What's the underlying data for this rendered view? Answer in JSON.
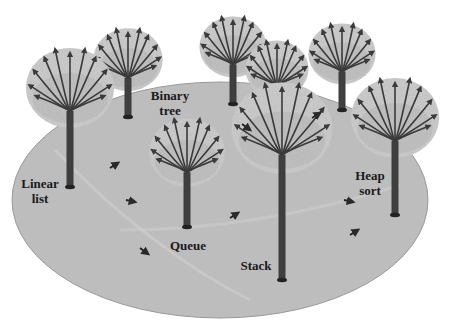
{
  "diagram": {
    "type": "illustration",
    "colors": {
      "ground": "#b9b9b9",
      "ground_edge": "#9a9a9a",
      "foliage": "#c9c9c9",
      "foliage_dark": "#aaaaaa",
      "trunk": "#4a4a4a",
      "branch": "#3a3a3a",
      "label": "#1a1a1a"
    },
    "labels": {
      "linear_list": "Linear\nlist",
      "binary_tree": "Binary\ntree",
      "queue": "Queue",
      "stack": "Stack",
      "heap_sort": "Heap\nsort"
    },
    "trees": [
      {
        "id": "linear-list-tree",
        "x": 70,
        "top": 50,
        "base": 187,
        "crown_r": 42
      },
      {
        "id": "background-tree-1",
        "x": 128,
        "top": 30,
        "base": 117,
        "crown_r": 33
      },
      {
        "id": "binary-tree-back-1",
        "x": 233,
        "top": 18,
        "base": 104,
        "crown_r": 32
      },
      {
        "id": "binary-tree-back-2",
        "x": 277,
        "top": 42,
        "base": 130,
        "crown_r": 30
      },
      {
        "id": "background-tree-4",
        "x": 342,
        "top": 25,
        "base": 110,
        "crown_r": 32
      },
      {
        "id": "queue-tree",
        "x": 187,
        "top": 120,
        "base": 227,
        "crown_r": 36
      },
      {
        "id": "stack-tree",
        "x": 282,
        "top": 85,
        "base": 280,
        "crown_r": 48
      },
      {
        "id": "heap-sort-tree",
        "x": 395,
        "top": 80,
        "base": 215,
        "crown_r": 42
      }
    ],
    "arrows": [
      {
        "x": 110,
        "y": 168,
        "dir": "up-right"
      },
      {
        "x": 126,
        "y": 200,
        "dir": "right"
      },
      {
        "x": 140,
        "y": 248,
        "dir": "down-right"
      },
      {
        "x": 242,
        "y": 124,
        "dir": "down-right"
      },
      {
        "x": 312,
        "y": 118,
        "dir": "up-right"
      },
      {
        "x": 230,
        "y": 218,
        "dir": "up-right"
      },
      {
        "x": 344,
        "y": 200,
        "dir": "right"
      },
      {
        "x": 350,
        "y": 235,
        "dir": "up-right"
      }
    ]
  }
}
